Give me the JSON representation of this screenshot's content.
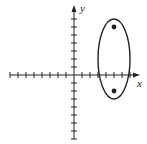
{
  "figure": {
    "x_axis_label": "x",
    "y_axis_label": "y",
    "origin_px": [
      74,
      75
    ],
    "unit_px": 8,
    "x_ticks": [
      -8,
      -7,
      -6,
      -5,
      -4,
      -3,
      -2,
      -1,
      1,
      2,
      3,
      4,
      5,
      6,
      7
    ],
    "y_ticks": [
      -8,
      -7,
      -6,
      -5,
      -4,
      -3,
      -2,
      -1,
      1,
      2,
      3,
      4,
      5,
      6,
      7
    ],
    "ellipse": {
      "center": [
        5,
        2
      ],
      "semi_axis_x": 2,
      "semi_axis_y": 5
    },
    "points": [
      [
        5,
        6
      ],
      [
        5,
        -2
      ]
    ],
    "colors": {
      "stroke": "#222222",
      "background": "#ffffff"
    }
  }
}
